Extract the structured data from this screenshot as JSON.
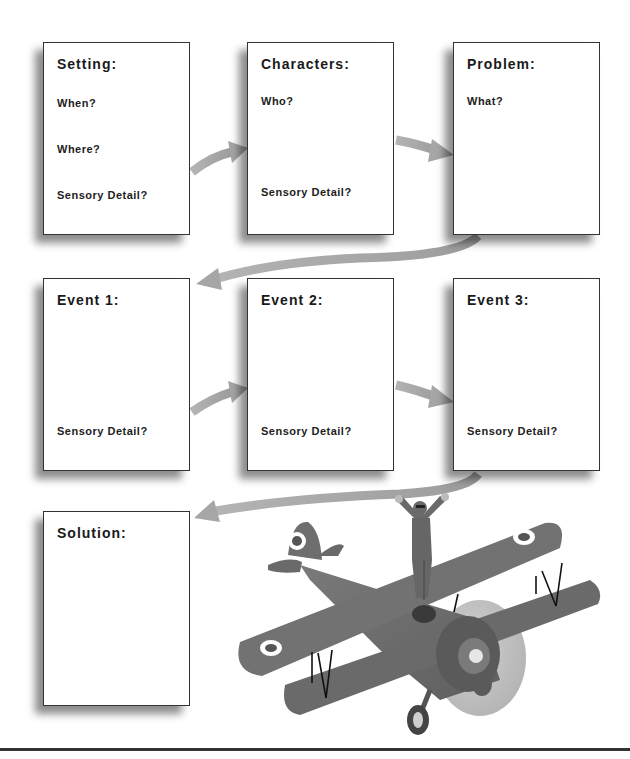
{
  "worksheet": {
    "boxes": [
      {
        "title": "Setting:",
        "prompts": [
          "When?",
          "Where?",
          "Sensory Detail?"
        ]
      },
      {
        "title": "Characters:",
        "prompts": [
          "Who?",
          "Sensory Detail?"
        ]
      },
      {
        "title": "Problem:",
        "prompts": [
          "What?"
        ]
      },
      {
        "title": "Event 1:",
        "prompts": [
          "Sensory Detail?"
        ]
      },
      {
        "title": "Event 2:",
        "prompts": [
          "Sensory Detail?"
        ]
      },
      {
        "title": "Event 3:",
        "prompts": [
          "Sensory Detail?"
        ]
      },
      {
        "title": "Solution:",
        "prompts": []
      }
    ],
    "illustration": "biplane-with-wing-walker",
    "colors": {
      "box_border": "#333333",
      "arrow": "#a8a8a8",
      "plane_body": "#6e6e6e",
      "shadow": "#666666"
    }
  }
}
